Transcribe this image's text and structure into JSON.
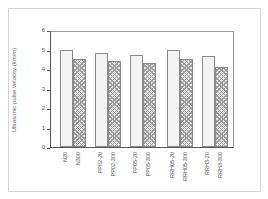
{
  "chart_data": {
    "type": "bar",
    "title": "",
    "xlabel": "",
    "ylabel": "Ultrasonic pulse velocity (km/m)",
    "ylim": [
      0,
      6
    ],
    "yticks": [
      "0",
      "1",
      "2",
      "3",
      "4",
      "5",
      "6"
    ],
    "grid": false,
    "legend": "none",
    "categories": [
      "N20",
      "N300",
      "PP02-20",
      "PP02-300",
      "PP05-20",
      "PP05-300",
      "RRH05-20",
      "RRH05-300",
      "RRH3-20",
      "RRH3-300"
    ],
    "values": [
      4.95,
      4.5,
      4.8,
      4.4,
      4.7,
      4.3,
      4.97,
      4.5,
      4.65,
      4.1
    ],
    "groups": [
      {
        "labels": [
          "N20",
          "N300"
        ],
        "values": [
          4.95,
          4.5
        ]
      },
      {
        "labels": [
          "PP02-20",
          "PP02-300"
        ],
        "values": [
          4.8,
          4.4
        ]
      },
      {
        "labels": [
          "PP05-20",
          "PP05-300"
        ],
        "values": [
          4.7,
          4.3
        ]
      },
      {
        "labels": [
          "RRH05-20",
          "RRH05-300"
        ],
        "values": [
          4.97,
          4.5
        ]
      },
      {
        "labels": [
          "RRH3-20",
          "RRH3-300"
        ],
        "values": [
          4.65,
          4.1
        ]
      }
    ],
    "series_styles": {
      "20": "light dotted",
      "300": "dark crosshatch"
    }
  }
}
